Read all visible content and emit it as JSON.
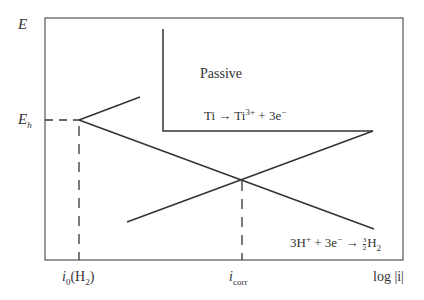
{
  "diagram": {
    "type": "Evans diagram (polarization)",
    "axes": {
      "y_label": "E",
      "x_label": "log |i|",
      "y_ticks": [
        {
          "label_main": "E",
          "label_sub": "h"
        }
      ],
      "x_ticks": [
        {
          "label_main": "i",
          "label_sub": "0",
          "label_suffix": "(H",
          "label_suffix_sub": "2",
          "label_close": ")"
        },
        {
          "label_main": "i",
          "label_sub": "corr"
        }
      ]
    },
    "regions": {
      "passive_label": "Passive"
    },
    "reactions": {
      "anodic": {
        "lhs": "Ti → Ti",
        "charge": "3+",
        "rhs": " + 3e",
        "rhs_sup": "−"
      },
      "cathodic": {
        "lhs": "3H",
        "lhs_sup": "+",
        "mid": " + 3e",
        "mid_sup": "−",
        "arrow": " → ",
        "frac_num": "3",
        "frac_den": "2",
        "product": "H",
        "product_sub": "2"
      }
    },
    "colors": {
      "line": "#333333",
      "background": "#ffffff"
    }
  }
}
